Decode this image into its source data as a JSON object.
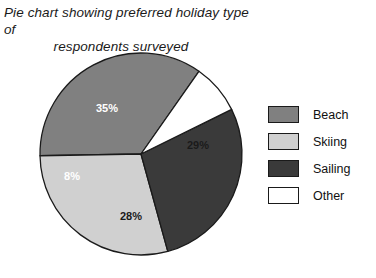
{
  "chart_data": {
    "type": "pie",
    "title": "Pie chart showing preferred holiday type of respondents surveyed",
    "title_line1": "Pie chart showing preferred holiday type of",
    "title_line2": "respondents surveyed",
    "categories": [
      "Beach",
      "Skiing",
      "Sailing",
      "Other"
    ],
    "values": [
      35,
      29,
      28,
      8
    ],
    "value_labels": [
      "35%",
      "29%",
      "28%",
      "8%"
    ],
    "unit": "%",
    "colors": [
      "#808080",
      "#d0d0d0",
      "#3a3a3a",
      "#ffffff"
    ],
    "label_text_colors": [
      "#ffffff",
      "#1a1a1a",
      "#ffffff",
      "#1a1a1a"
    ],
    "slice_border_color": "#1a1a1a",
    "start_angle_deg": 35,
    "direction": "counterclockwise",
    "legend_position": "right",
    "grid": false,
    "xlabel": "",
    "ylabel": "",
    "geometry": {
      "cx": 141,
      "cy": 154,
      "r": 101
    },
    "label_positions": [
      {
        "label": "35%",
        "x": 107,
        "y": 109
      },
      {
        "label": "29%",
        "x": 198,
        "y": 146
      },
      {
        "label": "8%",
        "x": 72,
        "y": 177
      },
      {
        "label": "28%",
        "x": 131,
        "y": 217
      }
    ]
  },
  "legend": {
    "items": [
      {
        "label": "Beach",
        "color": "#808080"
      },
      {
        "label": "Skiing",
        "color": "#d0d0d0"
      },
      {
        "label": "Sailing",
        "color": "#3a3a3a"
      },
      {
        "label": "Other",
        "color": "#ffffff"
      }
    ]
  }
}
